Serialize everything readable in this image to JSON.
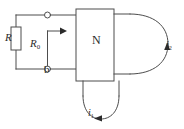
{
  "figure": {
    "type": "circuit-diagram",
    "stroke_color": "#4d4d4d",
    "text_color": "#2b2b2b",
    "background_color": "#ffffff"
  },
  "labels": {
    "resistor_R": "R",
    "resistor_R0_symbol": "R",
    "resistor_R0_subscript": "0",
    "terminal_b": "b",
    "network_box": "N",
    "current_i2_symbol": "i",
    "current_i2_subscript": "2",
    "current_i1_symbol": "i",
    "current_i1_subscript": "1"
  },
  "elements": {
    "left_branch": "R",
    "adjustable_branch": "R0",
    "network": "N",
    "top_terminal": "open-circle-terminal",
    "bottom_terminal": "open-circle-terminal",
    "right_loop": "port-2-loop",
    "bottom_loop": "port-1-loop"
  }
}
